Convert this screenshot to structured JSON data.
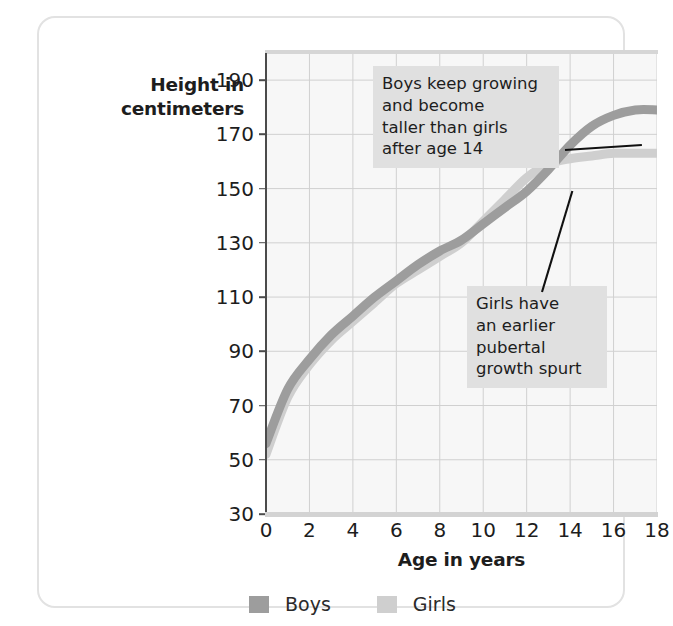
{
  "chart_data": {
    "type": "line",
    "title": "",
    "xlabel": "Age in years",
    "ylabel_lines": [
      "Height in",
      "centimeters"
    ],
    "xlim": [
      0,
      18
    ],
    "ylim": [
      30,
      200
    ],
    "xticks": [
      0,
      2,
      4,
      6,
      8,
      10,
      12,
      14,
      16,
      18
    ],
    "yticks": [
      30,
      50,
      70,
      90,
      110,
      130,
      150,
      170,
      190
    ],
    "grid": true,
    "legend_position": "below-axis",
    "x": [
      0,
      1,
      2,
      3,
      4,
      5,
      6,
      7,
      8,
      9,
      10,
      11,
      12,
      13,
      14,
      15,
      16,
      17,
      18
    ],
    "series": [
      {
        "name": "Boys",
        "color": "#9d9d9d",
        "values": [
          56,
          76,
          87,
          96,
          103,
          110,
          116,
          122,
          127,
          131,
          137,
          143,
          149,
          157,
          166,
          173,
          177,
          179,
          179
        ]
      },
      {
        "name": "Girls",
        "color": "#cfcfcf",
        "values": [
          52,
          73,
          85,
          94,
          101,
          108,
          115,
          120,
          125,
          130,
          138,
          146,
          154,
          159,
          161,
          162,
          163,
          163,
          163
        ]
      }
    ],
    "annotations": [
      {
        "id": "boys-note",
        "text": "Boys keep growing\nand become\ntaller than girls\nafter age 14",
        "target_x": 15.6,
        "target_y": 172
      },
      {
        "id": "girls-note",
        "text": "Girls have\nan earlier\npubertal\ngrowth spurt",
        "target_x": 12.4,
        "target_y": 155
      }
    ]
  },
  "legend": {
    "items": [
      {
        "label": "Boys",
        "color": "#9d9d9d"
      },
      {
        "label": "Girls",
        "color": "#cfcfcf"
      }
    ]
  }
}
